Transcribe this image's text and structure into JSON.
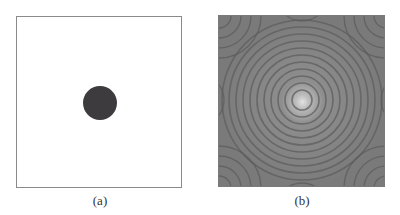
{
  "figure": {
    "panels": [
      {
        "id": "a",
        "caption": "(a)",
        "description": "white square with dark filled circle at center",
        "background": "#ffffff",
        "circle_color": "#3e3b3e"
      },
      {
        "id": "b",
        "caption": "(b)",
        "description": "gray square with concentric ring (Airy/diffraction) pattern, bright center",
        "background": "#7d7d7d",
        "center_color": "#d8d8d8"
      }
    ]
  }
}
